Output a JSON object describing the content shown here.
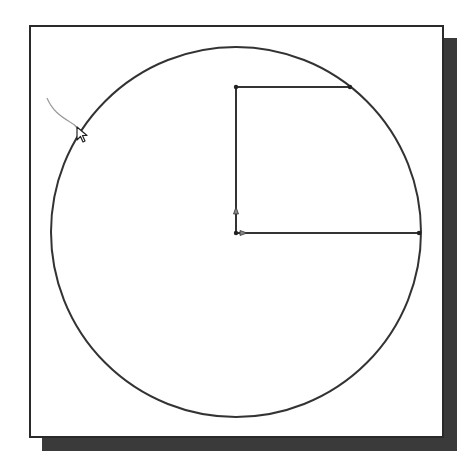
{
  "canvas": {
    "width": 466,
    "height": 471,
    "background": "#ffffff"
  },
  "viewport": {
    "x": 29,
    "y": 25,
    "width": 415,
    "height": 413,
    "border_color": "#2a2a2a",
    "fill": "#ffffff"
  },
  "shadow": {
    "offset_x": 13,
    "offset_y": 13,
    "color": "#3a3a3a"
  },
  "sketch": {
    "stroke_color": "#333333",
    "circle": {
      "cx": 236,
      "cy": 232,
      "r": 185
    },
    "profile_lines": [
      {
        "name": "vertical-line",
        "x1": 236,
        "y1": 87,
        "x2": 236,
        "y2": 233
      },
      {
        "name": "top-horizontal-line",
        "x1": 236,
        "y1": 87,
        "x2": 350,
        "y2": 87
      },
      {
        "name": "bottom-horizontal-line",
        "x1": 236,
        "y1": 233,
        "x2": 419,
        "y2": 233
      }
    ],
    "endpoints": [
      {
        "x": 236,
        "y": 87
      },
      {
        "x": 350,
        "y": 87
      },
      {
        "x": 419,
        "y": 233
      },
      {
        "x": 236,
        "y": 233
      }
    ],
    "direction_arrows": [
      {
        "name": "vertical-direction-arrow",
        "x": 236,
        "y": 210,
        "dir": "up"
      },
      {
        "name": "horizontal-direction-arrow",
        "x": 244,
        "y": 233,
        "dir": "right"
      }
    ]
  },
  "cursor": {
    "x": 77,
    "y": 127,
    "trail_color": "#9a9a9a",
    "trail_path": "M47 98 C 52 110, 60 116, 70 122 C 74 124, 76 126, 78 129"
  }
}
